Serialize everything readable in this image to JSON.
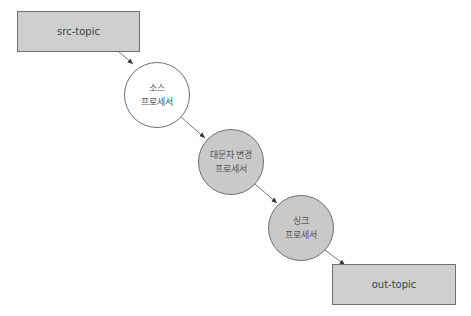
{
  "diagram": {
    "type": "processor-topology",
    "nodes": [
      {
        "id": "src-topic",
        "kind": "topic",
        "label": "src-topic"
      },
      {
        "id": "source-processor",
        "kind": "processor",
        "line1": "소스",
        "line2": "프로세서",
        "fill": "#ffffff"
      },
      {
        "id": "uppercase-processor",
        "kind": "processor",
        "line1": "대문자 변경",
        "line2": "프로세서",
        "fill": "#c9c9c9"
      },
      {
        "id": "sink-processor",
        "kind": "processor",
        "line1": "싱크",
        "line2": "프로세서",
        "fill": "#c9c9c9"
      },
      {
        "id": "out-topic",
        "kind": "topic",
        "label": "out-topic"
      }
    ],
    "edges": [
      {
        "from": "src-topic",
        "to": "source-processor"
      },
      {
        "from": "source-processor",
        "to": "uppercase-processor"
      },
      {
        "from": "uppercase-processor",
        "to": "sink-processor"
      },
      {
        "from": "sink-processor",
        "to": "out-topic"
      }
    ]
  }
}
